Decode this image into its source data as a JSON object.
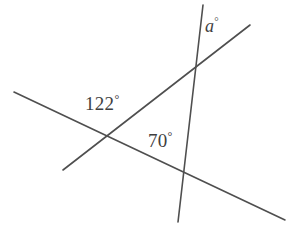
{
  "figure": {
    "background_color": "#ffffff",
    "line_color": "#4f4f4f",
    "text_color": "#3f3f3f",
    "width": 297,
    "height": 236
  },
  "labels": {
    "angle_122": "122",
    "angle_70": "70",
    "angle_a": "a",
    "degree_symbol": "°"
  },
  "geometry": {
    "lines": [
      {
        "name": "shallow-descending-line",
        "x1": 14,
        "y1": 92,
        "x2": 285,
        "y2": 220
      },
      {
        "name": "ascending-line",
        "x1": 63,
        "y1": 170,
        "x2": 250,
        "y2": 25
      },
      {
        "name": "steep-vertical-line",
        "x1": 203,
        "y1": 5,
        "x2": 178,
        "y2": 222
      }
    ],
    "intersections": [
      {
        "name": "left-vertex",
        "x": 108,
        "y": 139
      },
      {
        "name": "top-vertex",
        "x": 201,
        "y": 62
      },
      {
        "name": "bottom-vertex",
        "x": 186,
        "y": 176
      }
    ]
  }
}
